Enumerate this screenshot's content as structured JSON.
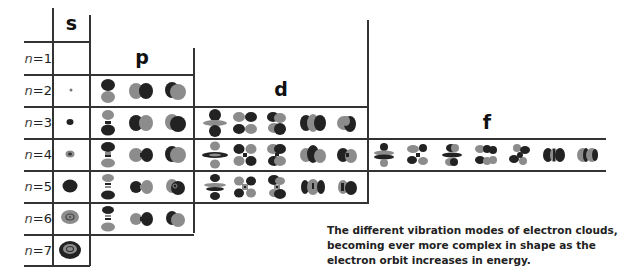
{
  "diagram": {
    "type": "orbital-shape-table",
    "column_headers": {
      "s": "s",
      "p": "p",
      "d": "d",
      "f": "f"
    },
    "rows": [
      {
        "n_prefix": "n",
        "n_value": "=1"
      },
      {
        "n_prefix": "n",
        "n_value": "=2"
      },
      {
        "n_prefix": "n",
        "n_value": "=3"
      },
      {
        "n_prefix": "n",
        "n_value": "=4"
      },
      {
        "n_prefix": "n",
        "n_value": "=5"
      },
      {
        "n_prefix": "n",
        "n_value": "=6"
      },
      {
        "n_prefix": "n",
        "n_value": "=7"
      }
    ],
    "orbital_counts": {
      "s": {
        "rows": [
          "n=2",
          "n=3",
          "n=4",
          "n=5",
          "n=6",
          "n=7"
        ],
        "per_row": 1
      },
      "p": {
        "rows": [
          "n=2",
          "n=3",
          "n=4",
          "n=5",
          "n=6"
        ],
        "per_row": 3
      },
      "d": {
        "rows": [
          "n=3",
          "n=4",
          "n=5"
        ],
        "per_row": 5
      },
      "f": {
        "rows": [
          "n=4"
        ],
        "per_row": 7
      }
    },
    "colors": {
      "dark_lobe": "#2a2a2a",
      "light_lobe": "#8c8c8c",
      "grid": "#333333"
    },
    "caption": "The different vibration modes of electron clouds, becoming ever more complex in shape as the electron orbit increases in energy."
  }
}
